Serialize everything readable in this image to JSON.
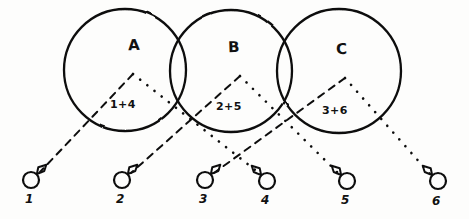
{
  "figure": {
    "title": "",
    "ink_color": "#111111",
    "background_color": "#fdfdfc"
  },
  "sets": [
    {
      "id": "A",
      "label": "A",
      "expression": "1+4",
      "label_x": 128,
      "label_y": 36,
      "expr_x": 110,
      "expr_y": 98,
      "circle": {
        "cx": 125,
        "cy": 70,
        "r": 61
      },
      "apex": {
        "x": 133,
        "y": 74
      },
      "dashed_target_node": "1",
      "dotted_target_node": "4"
    },
    {
      "id": "B",
      "label": "B",
      "expression": "2+5",
      "label_x": 228,
      "label_y": 38,
      "expr_x": 216,
      "expr_y": 100,
      "circle": {
        "cx": 231,
        "cy": 71,
        "r": 61
      },
      "apex": {
        "x": 240,
        "y": 76
      },
      "dashed_target_node": "2",
      "dotted_target_node": "5"
    },
    {
      "id": "C",
      "label": "C",
      "expression": "3+6",
      "label_x": 336,
      "label_y": 40,
      "expr_x": 322,
      "expr_y": 104,
      "circle": {
        "cx": 339,
        "cy": 71,
        "r": 62
      },
      "apex": {
        "x": 345,
        "y": 78
      },
      "dashed_target_node": "3",
      "dotted_target_node": "6"
    }
  ],
  "nodes": [
    {
      "id": "1",
      "label": "1",
      "cx": 31,
      "cy": 180,
      "r": 8,
      "flag_side": "right",
      "label_x": 25,
      "label_y": 197
    },
    {
      "id": "2",
      "label": "2",
      "cx": 122,
      "cy": 180,
      "r": 8,
      "flag_side": "right",
      "label_x": 116,
      "label_y": 197
    },
    {
      "id": "3",
      "label": "3",
      "cx": 205,
      "cy": 180,
      "r": 8,
      "flag_side": "right",
      "label_x": 199,
      "label_y": 197
    },
    {
      "id": "4",
      "label": "4",
      "cx": 267,
      "cy": 181,
      "r": 8,
      "flag_side": "left",
      "label_x": 261,
      "label_y": 198
    },
    {
      "id": "5",
      "label": "5",
      "cx": 347,
      "cy": 181,
      "r": 8,
      "flag_side": "left",
      "label_x": 341,
      "label_y": 198
    },
    {
      "id": "6",
      "label": "6",
      "cx": 438,
      "cy": 181,
      "r": 8,
      "flag_side": "left",
      "label_x": 432,
      "label_y": 199
    }
  ],
  "connectors": [
    {
      "id": "A-1",
      "from_set": "A",
      "to_node": "1",
      "style": "dashed",
      "x1": 133,
      "y1": 74,
      "x2": 40,
      "y2": 172
    },
    {
      "id": "A-4",
      "from_set": "A",
      "to_node": "4",
      "style": "dotted",
      "x1": 133,
      "y1": 74,
      "x2": 259,
      "y2": 173
    },
    {
      "id": "B-2",
      "from_set": "B",
      "to_node": "2",
      "style": "dashed",
      "x1": 240,
      "y1": 76,
      "x2": 131,
      "y2": 173
    },
    {
      "id": "B-5",
      "from_set": "B",
      "to_node": "5",
      "style": "dotted",
      "x1": 240,
      "y1": 76,
      "x2": 339,
      "y2": 174
    },
    {
      "id": "C-3",
      "from_set": "C",
      "to_node": "3",
      "style": "dashed",
      "x1": 345,
      "y1": 78,
      "x2": 214,
      "y2": 173
    },
    {
      "id": "C-6",
      "from_set": "C",
      "to_node": "6",
      "style": "dotted",
      "x1": 345,
      "y1": 78,
      "x2": 430,
      "y2": 174
    }
  ]
}
